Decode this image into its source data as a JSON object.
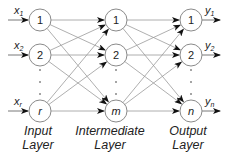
{
  "diagram": {
    "type": "neural-network",
    "colors": {
      "edge": "#9a9a9a",
      "node_stroke": "#8a8a8a",
      "arrow": "#111111",
      "text": "#222222",
      "background": "#ffffff"
    },
    "layers": [
      {
        "id": "input",
        "label_line1": "Input",
        "label_line2": "Layer",
        "x": 40,
        "nodes": [
          {
            "label": "1",
            "y": 20
          },
          {
            "label": "2",
            "y": 55
          },
          {
            "label": "r",
            "y": 111,
            "italic": true
          }
        ]
      },
      {
        "id": "intermediate",
        "label_line1": "Intermediate",
        "label_line2": "Layer",
        "x": 116,
        "nodes": [
          {
            "label": "1",
            "y": 20
          },
          {
            "label": "2",
            "y": 55
          },
          {
            "label": "m",
            "y": 111,
            "italic": true
          }
        ]
      },
      {
        "id": "output",
        "label_line1": "Output",
        "label_line2": "Layer",
        "x": 191,
        "nodes": [
          {
            "label": "1",
            "y": 20
          },
          {
            "label": "2",
            "y": 55
          },
          {
            "label": "n",
            "y": 111,
            "italic": true
          }
        ]
      }
    ],
    "inputs": [
      {
        "base": "x",
        "sub": "1"
      },
      {
        "base": "x",
        "sub": "2"
      },
      {
        "base": "x",
        "sub": "r"
      }
    ],
    "outputs": [
      {
        "base": "y",
        "sub": "1"
      },
      {
        "base": "y",
        "sub": "2"
      },
      {
        "base": "y",
        "sub": "n"
      }
    ],
    "ellipsis": "⋮",
    "connectivity": "fully-connected"
  }
}
